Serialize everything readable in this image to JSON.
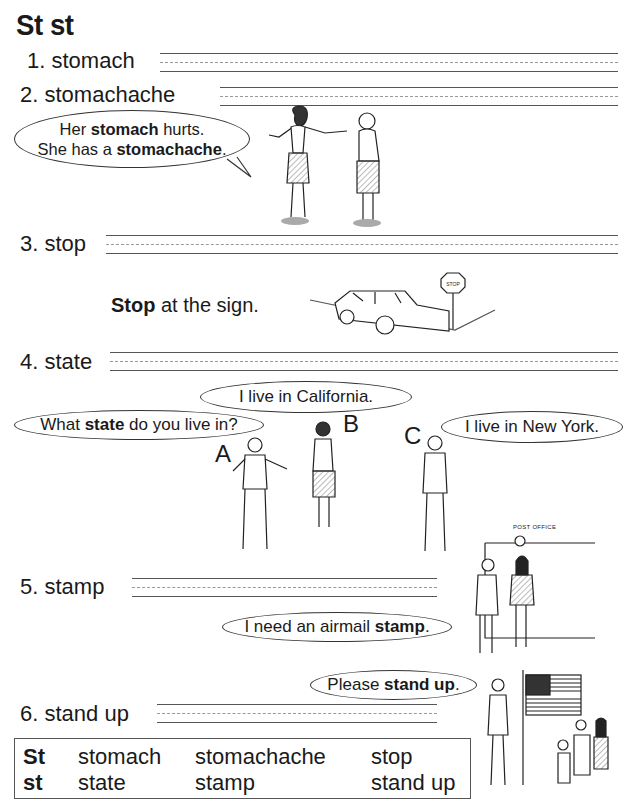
{
  "page": {
    "title": "St st"
  },
  "items": [
    {
      "number": "1.",
      "word": "stomach"
    },
    {
      "number": "2.",
      "word": "stomachache"
    },
    {
      "number": "3.",
      "word": "stop"
    },
    {
      "number": "4.",
      "word": "state"
    },
    {
      "number": "5.",
      "word": "stamp"
    },
    {
      "number": "6.",
      "word": "stand up"
    }
  ],
  "bubbles": {
    "stomach": {
      "line1_pre": "Her ",
      "line1_bold": "stomach",
      "line1_post": " hurts.",
      "line2_pre": "She has a ",
      "line2_bold": "stomachache",
      "line2_post": "."
    },
    "stop_caption": {
      "bold": "Stop",
      "rest": " at the sign."
    },
    "stop_sign_text": "STOP",
    "state_question": {
      "pre": "What ",
      "bold": "state",
      "post": " do you live in?"
    },
    "state_b": "I live in California.",
    "state_c": "I live in New York.",
    "stamp": {
      "pre": "I need an airmail ",
      "bold": "stamp",
      "post": "."
    },
    "stand_up": {
      "pre": "Please ",
      "bold": "stand up",
      "post": "."
    }
  },
  "speaker_labels": {
    "a": "A",
    "b": "B",
    "c": "C"
  },
  "post_office_sign": "POST OFFICE",
  "summary_box": {
    "row1": {
      "label": "St",
      "words": [
        "stomach",
        "stomachache",
        "stop"
      ]
    },
    "row2": {
      "label": "st",
      "words": [
        "state",
        "stamp",
        "stand up"
      ]
    }
  }
}
